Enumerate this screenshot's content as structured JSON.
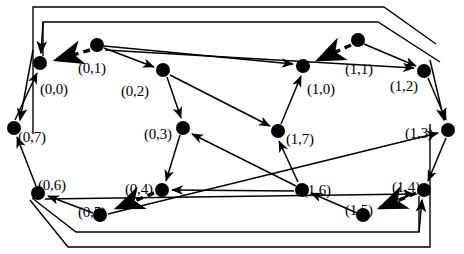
{
  "figure": {
    "type": "directed-graph-diagram",
    "background_color": "#ffffff",
    "stroke_color": "#000000",
    "node_fill_color": "#000000",
    "width": 464,
    "height": 254,
    "node_radius": 7
  },
  "nodes": [
    {
      "id": "0_0",
      "label": "(0,0)",
      "x": 40,
      "y": 63,
      "label_x": 40,
      "label_y": 82
    },
    {
      "id": "0_1",
      "label": "(0,1)",
      "x": 97,
      "y": 45,
      "label_x": 78,
      "label_y": 61
    },
    {
      "id": "0_2",
      "label": "(0,2)",
      "x": 163,
      "y": 70,
      "label_x": 121,
      "label_y": 84
    },
    {
      "id": "0_3",
      "label": "(0,3)",
      "x": 183,
      "y": 128,
      "label_x": 144,
      "label_y": 127
    },
    {
      "id": "0_4",
      "label": "(0,4)",
      "x": 162,
      "y": 190,
      "label_x": 125,
      "label_y": 182
    },
    {
      "id": "0_5",
      "label": "(0,5)",
      "x": 100,
      "y": 215,
      "label_x": 78,
      "label_y": 205
    },
    {
      "id": "0_6",
      "label": "(0,6)",
      "x": 38,
      "y": 193,
      "label_x": 38,
      "label_y": 178
    },
    {
      "id": "0_7",
      "label": "(0,7)",
      "x": 14,
      "y": 128,
      "label_x": 18,
      "label_y": 130
    },
    {
      "id": "1_0",
      "label": "(1,0)",
      "x": 303,
      "y": 66,
      "label_x": 307,
      "label_y": 82
    },
    {
      "id": "1_1",
      "label": "(1,1)",
      "x": 358,
      "y": 40,
      "label_x": 345,
      "label_y": 62
    },
    {
      "id": "1_2",
      "label": "(1,2)",
      "x": 424,
      "y": 71,
      "label_x": 390,
      "label_y": 79
    },
    {
      "id": "1_3",
      "label": "(1,3)",
      "x": 448,
      "y": 130,
      "label_x": 405,
      "label_y": 126
    },
    {
      "id": "1_4",
      "label": "(1,4)",
      "x": 424,
      "y": 190,
      "label_x": 392,
      "label_y": 180
    },
    {
      "id": "1_5",
      "label": "(1,5)",
      "x": 363,
      "y": 215,
      "label_x": 345,
      "label_y": 203
    },
    {
      "id": "1_6",
      "label": "(1,6)",
      "x": 302,
      "y": 190,
      "label_x": 303,
      "label_y": 183
    },
    {
      "id": "1_7",
      "label": "(1,7)",
      "x": 278,
      "y": 131,
      "label_x": 286,
      "label_y": 132
    }
  ],
  "edges": [
    {
      "from": "0_1",
      "to": "0_0",
      "style": "dashed",
      "arrow": "end"
    },
    {
      "from": "1_1",
      "to": "1_0",
      "style": "dashed",
      "arrow": "end"
    },
    {
      "from": "0_4",
      "to": "0_5",
      "style": "dashed",
      "arrow": "end"
    },
    {
      "from": "1_4",
      "to": "1_5",
      "style": "dashed",
      "arrow": "end"
    },
    {
      "from": "0_7",
      "to": "0_0",
      "style": "solid",
      "arrow": "end"
    },
    {
      "from": "0_6",
      "to": "0_7",
      "style": "solid",
      "arrow": "end"
    },
    {
      "from": "0_5",
      "to": "0_6",
      "style": "solid",
      "arrow": "end"
    },
    {
      "from": "0_1",
      "to": "0_2",
      "style": "solid",
      "arrow": "end"
    },
    {
      "from": "0_2",
      "to": "0_3",
      "style": "solid",
      "arrow": "end"
    },
    {
      "from": "0_3",
      "to": "0_4",
      "style": "solid",
      "arrow": "end"
    },
    {
      "from": "0_1",
      "to": "1_0",
      "style": "solid",
      "arrow": "end"
    },
    {
      "from": "0_2",
      "to": "1_7",
      "style": "solid",
      "arrow": "end"
    },
    {
      "from": "1_7",
      "to": "1_0",
      "style": "solid",
      "arrow": "end"
    },
    {
      "from": "1_6",
      "to": "1_7",
      "style": "solid",
      "arrow": "end"
    },
    {
      "from": "1_6",
      "to": "0_3",
      "style": "solid",
      "arrow": "end"
    },
    {
      "from": "1_5",
      "to": "1_6",
      "style": "solid",
      "arrow": "end"
    },
    {
      "from": "1_6",
      "to": "0_4",
      "style": "solid",
      "arrow": "end"
    },
    {
      "from": "1_2",
      "to": "1_3",
      "style": "solid",
      "arrow": "end"
    },
    {
      "from": "1_3",
      "to": "1_4",
      "style": "solid",
      "arrow": "end"
    },
    {
      "from": "1_1",
      "to": "1_2",
      "style": "solid",
      "arrow": "end"
    },
    {
      "from": "0_1",
      "to": "1_2",
      "style": "solid",
      "arrow": "end"
    },
    {
      "from": "0_5",
      "to": "1_3",
      "style": "solid",
      "arrow": "end"
    },
    {
      "from": "0_6",
      "to": "1_4",
      "style": "solid",
      "arrow": "end"
    }
  ],
  "outer_paths": [
    {
      "name": "outer-path-left-top",
      "description": "wrap-around from top-right down left side to node (0,7)"
    },
    {
      "name": "outer-path-left-inner",
      "description": "inner wrap-around from top-right down to node (0,0)"
    },
    {
      "name": "outer-path-right-bottom",
      "description": "wrap-around from bottom-left up right side to node (1,3)"
    },
    {
      "name": "outer-path-right-inner",
      "description": "inner wrap-around from bottom-left up to node (1,4)"
    }
  ]
}
